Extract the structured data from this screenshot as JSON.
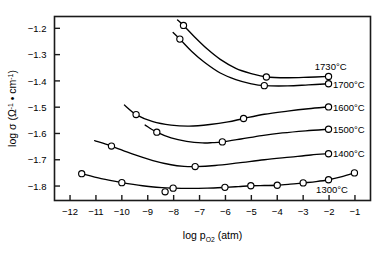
{
  "chart_data": {
    "type": "line",
    "title": "",
    "xlabel": "log p_O2 (atm)",
    "ylabel": "log sigma (Ohm^-1 . cm^-1)",
    "xlim": [
      -12.6,
      -0.4
    ],
    "ylim": [
      -1.855,
      -1.155
    ],
    "xticks": [
      -12,
      -11,
      -10,
      -9,
      -8,
      -7,
      -6,
      -5,
      -4,
      -3,
      -2,
      -1
    ],
    "yticks": [
      -1.2,
      -1.3,
      -1.4,
      -1.5,
      -1.6,
      -1.7,
      -1.8
    ],
    "xtick_labels": [
      "-12",
      "-11",
      "-10",
      "-9",
      "-8",
      "-7",
      "-6",
      "-5",
      "-4",
      "-3",
      "-2",
      "-1"
    ],
    "ytick_labels": [
      "-1.2",
      "-1.3",
      "-1.4",
      "-1.5",
      "-1.6",
      "-1.7",
      "-1.8"
    ],
    "grid": false,
    "legend_position": "right-inline",
    "marker": "open-circle",
    "series": [
      {
        "name": "1730°C",
        "label": "1730°C",
        "label_x": -2.55,
        "label_y": -1.345,
        "x": [
          -7.62,
          -4.42,
          -2.02
        ],
        "y": [
          -1.189,
          -1.385,
          -1.383
        ],
        "curve_x": [
          -7.85,
          -7.62,
          -7.2,
          -6.7,
          -6.2,
          -5.6,
          -5.0,
          -4.42,
          -3.6,
          -2.8,
          -2.02
        ],
        "curve_y": [
          -1.168,
          -1.189,
          -1.232,
          -1.279,
          -1.318,
          -1.352,
          -1.372,
          -1.385,
          -1.388,
          -1.386,
          -1.383
        ]
      },
      {
        "name": "1700°C",
        "label": "1700°C",
        "label_x": -1.85,
        "label_y": -1.414,
        "x": [
          -7.76,
          -4.5,
          -2.02
        ],
        "y": [
          -1.241,
          -1.418,
          -1.411
        ],
        "curve_x": [
          -8.02,
          -7.76,
          -7.3,
          -6.8,
          -6.2,
          -5.6,
          -5.0,
          -4.5,
          -3.6,
          -2.8,
          -2.02
        ],
        "curve_y": [
          -1.216,
          -1.241,
          -1.288,
          -1.33,
          -1.37,
          -1.395,
          -1.411,
          -1.418,
          -1.419,
          -1.415,
          -1.411
        ]
      },
      {
        "name": "1600°C",
        "label": "1600°C",
        "label_x": -1.85,
        "label_y": -1.501,
        "x": [
          -9.45,
          -5.3,
          -2.02
        ],
        "y": [
          -1.528,
          -1.543,
          -1.499
        ],
        "curve_x": [
          -9.9,
          -9.45,
          -8.8,
          -8.1,
          -7.4,
          -6.6,
          -5.9,
          -5.3,
          -4.5,
          -3.6,
          -2.8,
          -2.02
        ],
        "curve_y": [
          -1.492,
          -1.528,
          -1.555,
          -1.568,
          -1.572,
          -1.566,
          -1.556,
          -1.543,
          -1.527,
          -1.515,
          -1.506,
          -1.499
        ]
      },
      {
        "name": "1500°C",
        "label": "1500°C",
        "label_x": -1.85,
        "label_y": -1.586,
        "x": [
          -8.65,
          -6.12,
          -2.02
        ],
        "y": [
          -1.595,
          -1.632,
          -1.584
        ],
        "curve_x": [
          -9.1,
          -8.65,
          -8.1,
          -7.5,
          -6.9,
          -6.5,
          -6.12,
          -5.4,
          -4.6,
          -3.8,
          -2.9,
          -2.02
        ],
        "curve_y": [
          -1.568,
          -1.595,
          -1.617,
          -1.63,
          -1.636,
          -1.635,
          -1.632,
          -1.621,
          -1.608,
          -1.598,
          -1.59,
          -1.584
        ]
      },
      {
        "name": "1400°C",
        "label": "1400°C",
        "label_x": -1.85,
        "label_y": -1.677,
        "x": [
          -10.4,
          -7.17,
          -2.02
        ],
        "y": [
          -1.648,
          -1.726,
          -1.677
        ],
        "curve_x": [
          -11.05,
          -10.4,
          -9.6,
          -8.8,
          -8.1,
          -7.6,
          -7.17,
          -6.4,
          -5.5,
          -4.5,
          -3.5,
          -2.7,
          -2.02
        ],
        "curve_y": [
          -1.627,
          -1.648,
          -1.678,
          -1.703,
          -1.719,
          -1.725,
          -1.726,
          -1.722,
          -1.712,
          -1.7,
          -1.69,
          -1.682,
          -1.677
        ]
      },
      {
        "name": "1300°C",
        "label": "1300°C",
        "label_x": -2.5,
        "label_y": -1.812,
        "x": [
          -11.55,
          -10.0,
          -8.33,
          -8.02,
          -6.02,
          -5.02,
          -4.0,
          -3.0,
          -2.02,
          -1.02
        ],
        "y": [
          -1.753,
          -1.787,
          -1.822,
          -1.808,
          -1.805,
          -1.799,
          -1.797,
          -1.788,
          -1.776,
          -1.75
        ],
        "curve_x": [
          -11.55,
          -10.8,
          -10.0,
          -9.2,
          -8.45,
          -8.02,
          -7.4,
          -6.7,
          -6.02,
          -5.5,
          -5.02,
          -4.5,
          -4.0,
          -3.5,
          -3.0,
          -2.5,
          -2.02,
          -1.5,
          -1.02
        ],
        "curve_y": [
          -1.753,
          -1.772,
          -1.787,
          -1.799,
          -1.806,
          -1.808,
          -1.809,
          -1.808,
          -1.805,
          -1.802,
          -1.799,
          -1.798,
          -1.797,
          -1.793,
          -1.788,
          -1.783,
          -1.776,
          -1.764,
          -1.75
        ]
      }
    ]
  },
  "axis": {
    "x_title_main": "log p",
    "x_title_sub": "O",
    "x_title_sub2": "2",
    "x_title_tail": " (atm)",
    "y_title_main": "log σ (Ω",
    "y_title_sup1": "-1",
    "y_title_mid": " • cm",
    "y_title_sup2": "-1",
    "y_title_tail": ")"
  },
  "style": {
    "line_color": "#000000",
    "marker_fill": "#ffffff",
    "marker_stroke": "#000000",
    "frame_color": "#1a1a1a",
    "background": "#ffffff"
  }
}
